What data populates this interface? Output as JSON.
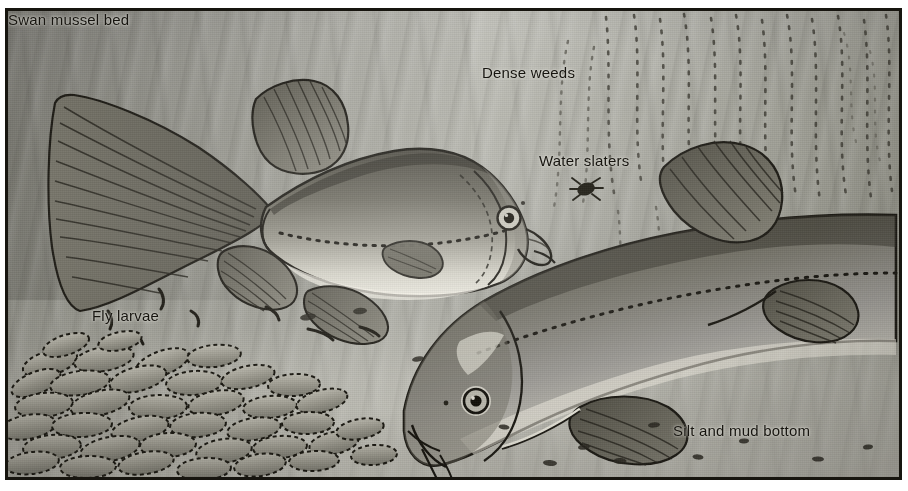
{
  "figure": {
    "medium": "halftone grayscale illustration",
    "frame": {
      "border_color": "#17150f",
      "paper_color": "#ffffff",
      "water_color": "#a2a299"
    }
  },
  "labels": [
    {
      "id": "dense-weeds",
      "text": "Dense weeds",
      "position": "top-center",
      "refers_to": "dotted vertical weed fronds filling the upper right water column"
    },
    {
      "id": "water-slaters",
      "text": "Water slaters",
      "position": "upper-center-right",
      "refers_to": "small dark crustacean drifting in mid water"
    },
    {
      "id": "fly-larvae",
      "text": "Fly larvae",
      "position": "mid-left",
      "refers_to": "short curved dark larvae on the silt above the mussel bed"
    },
    {
      "id": "swan-mussel-bed",
      "text": "Swan mussel bed",
      "position": "lower-left-center",
      "refers_to": "massed oval mussel shells half-buried in the bottom"
    },
    {
      "id": "silt-and-mud-bottom",
      "text": "Silt and mud bottom",
      "position": "bottom-right",
      "refers_to": "pale soft sediment floor of the pond"
    }
  ],
  "subjects": [
    {
      "id": "tench-upper",
      "common_name": "Tench",
      "pose": "swimming left to right, full lateral profile, upper half of plate",
      "features": [
        "rounded paddle-shaped caudal fin",
        "high rounded dorsal fin",
        "rounded pelvic and anal fins",
        "dotted lateral line along the flank",
        "small round eye with dark pupil",
        "single short barbel at the corner of the mouth"
      ]
    },
    {
      "id": "tench-lower",
      "common_name": "Tench",
      "pose": "head down, nosing the bottom, large foreground fish at right",
      "features": [
        "blunt head angled toward the silt",
        "prominent eye with pale highlight ring",
        "rounded pectoral and pelvic fins",
        "thick deep body with dotted lateral line",
        "rounded dorsal fin near the top edge"
      ]
    }
  ],
  "scene_elements": [
    {
      "id": "dense-weeds-fronds",
      "count": 14,
      "description": "dotted strands rising through the upper right water"
    },
    {
      "id": "water-slater",
      "count": 1,
      "description": "dark isopod silhouette in open water"
    },
    {
      "id": "fly-larvae-group",
      "count": 7,
      "description": "short comma-shaped larvae on the silt"
    },
    {
      "id": "swan-mussel-shells",
      "count": 46,
      "description": "overlapping oval shells forming the bed"
    },
    {
      "id": "silt-debris",
      "count": 12,
      "description": "small dark flecks scattered across the mud bottom"
    }
  ]
}
